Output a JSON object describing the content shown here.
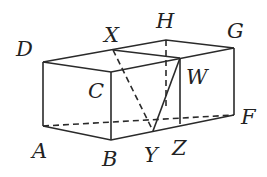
{
  "diagram": {
    "type": "3d-cuboid-geometry",
    "labels": {
      "A": "A",
      "B": "B",
      "C": "C",
      "D": "D",
      "F": "F",
      "G": "G",
      "H": "H",
      "W": "W",
      "X": "X",
      "Y": "Y",
      "Z": "Z"
    },
    "points": {
      "A": [
        43,
        126
      ],
      "B": [
        111,
        140
      ],
      "F": [
        234,
        115
      ],
      "D": [
        43,
        62
      ],
      "C": [
        111,
        72
      ],
      "G": [
        234,
        48
      ],
      "H": [
        166,
        40
      ],
      "X": [
        113,
        50
      ],
      "W": [
        180,
        58
      ],
      "Z": [
        180,
        124
      ],
      "Y": [
        153,
        131
      ],
      "Hbot": [
        166,
        108
      ]
    },
    "colors": {
      "stroke": "#2a2a2a",
      "background": "#ffffff"
    }
  }
}
